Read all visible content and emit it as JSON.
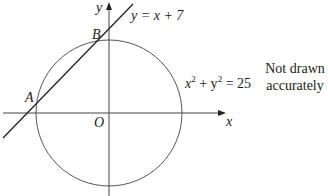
{
  "diagram": {
    "axes": {
      "x_label": "x",
      "y_label": "y",
      "origin_label": "O"
    },
    "line": {
      "equation": "y = x + 7"
    },
    "circle": {
      "equation_lhs": "x",
      "equation_mid": " + y",
      "equation_rhs": " = 25",
      "exp": "2"
    },
    "points": {
      "A": "A",
      "B": "B"
    },
    "note": {
      "line1": "Not drawn",
      "line2": "accurately"
    }
  }
}
